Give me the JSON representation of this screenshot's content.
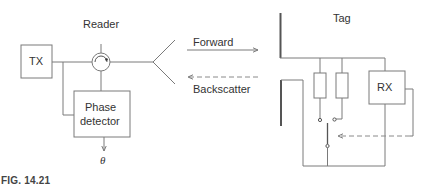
{
  "figure": {
    "caption": "FIG. 14.21",
    "reader": {
      "title": "Reader",
      "tx_label": "TX",
      "phase_detector_line1": "Phase",
      "phase_detector_line2": "detector",
      "output_symbol": "θ"
    },
    "link": {
      "forward_label": "Forward",
      "backscatter_label": "Backscatter"
    },
    "tag": {
      "title": "Tag",
      "rx_label": "RX"
    },
    "colors": {
      "line": "#7a7a7a",
      "dashed": "#8a8a8a",
      "text": "#333333"
    }
  }
}
